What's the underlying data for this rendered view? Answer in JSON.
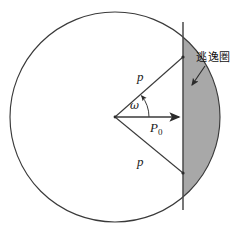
{
  "figure": {
    "title_text": "",
    "background_color": "#ffffff",
    "stroke_color": "#3a3a3a",
    "shade_color": "#a8a8a8",
    "text_color": "#1a1a1a",
    "labels": {
      "radius_upper": "p",
      "radius_lower": "p",
      "axial_distance": "P",
      "axial_distance_subscript": "0",
      "angle": "ω",
      "annotation": "逃逸圏"
    },
    "geometry": {
      "circle_center_x": 115,
      "circle_center_y": 117,
      "circle_radius": 105,
      "chord_line_x": 183,
      "chord_top_y": 57,
      "chord_bottom_y": 173,
      "vertical_line_top_y": 22,
      "vertical_line_bottom_y": 210,
      "arrow_tail_x": 205,
      "arrow_tail_y": 66,
      "arrow_head_x": 191,
      "arrow_head_y": 86,
      "angle_arc_radius": 34
    }
  }
}
